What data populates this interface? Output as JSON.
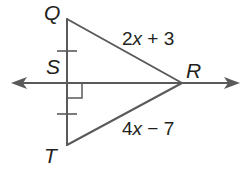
{
  "diagram": {
    "type": "geometry-triangle-with-perpendicular-bisector",
    "vertices": {
      "Q": {
        "label": "Q"
      },
      "S": {
        "label": "S"
      },
      "R": {
        "label": "R"
      },
      "T": {
        "label": "T"
      }
    },
    "segments": {
      "QR": {
        "expression_coef": "2",
        "expression_var": "x",
        "expression_rest": " + 3",
        "full": "2x + 3"
      },
      "TR": {
        "expression_coef": "4",
        "expression_var": "x",
        "expression_rest": " − 7",
        "full": "4x − 7"
      }
    },
    "markings": {
      "congruent_ticks": [
        "QS",
        "ST"
      ],
      "right_angle_at": "S",
      "line_through": "SR (line with arrows both ends)"
    },
    "colors": {
      "line": "#5a5a5a",
      "text": "#231f20",
      "background": "#ffffff"
    }
  }
}
